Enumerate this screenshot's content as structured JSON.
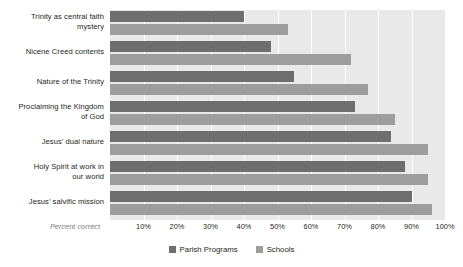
{
  "chart_data": {
    "type": "bar",
    "orientation": "horizontal",
    "title": "",
    "xlabel": "Percent correct",
    "ylabel": "",
    "xlim": [
      0,
      100
    ],
    "grid": true,
    "legend_position": "bottom-center",
    "categories": [
      "Trinity as central faith mystery",
      "Nicene Creed contents",
      "Nature of the Trinity",
      "Proclaiming the Kingdom of God",
      "Jesus’ dual nature",
      "Holy Spirit at work in our world",
      "Jesus’ salvific mission"
    ],
    "tick_labels": [
      "10%",
      "20%",
      "30%",
      "40%",
      "50%",
      "60%",
      "70%",
      "80%",
      "90%",
      "100%"
    ],
    "tick_values": [
      10,
      20,
      30,
      40,
      50,
      60,
      70,
      80,
      90,
      100
    ],
    "series": [
      {
        "name": "Parish Programs",
        "color": "#6e6e6e",
        "values": [
          40,
          48,
          55,
          73,
          84,
          88,
          90
        ]
      },
      {
        "name": "Schools",
        "color": "#9d9d9d",
        "values": [
          53,
          72,
          77,
          85,
          95,
          95,
          96
        ]
      }
    ]
  },
  "labels": {
    "categories_wrapped": [
      [
        "Trinity as central faith",
        "mystery"
      ],
      [
        "Nicene Creed contents"
      ],
      [
        "Nature of the Trinity"
      ],
      [
        "Proclaiming the Kingdom",
        "of God"
      ],
      [
        "Jesus’ dual nature"
      ],
      [
        "Holy Spirit at work in",
        "our world"
      ],
      [
        "Jesus’ salvific mission"
      ]
    ],
    "axis_note": "Percent correct"
  },
  "legend": {
    "items": [
      {
        "label": "Parish Programs",
        "color": "#6e6e6e"
      },
      {
        "label": "Schools",
        "color": "#9d9d9d"
      }
    ]
  },
  "colors": {
    "plot_background": "#e9e9e9",
    "gridline": "#ffffff",
    "parish": "#6e6e6e",
    "schools": "#9d9d9d",
    "text": "#231f20",
    "muted_text": "#808080"
  }
}
